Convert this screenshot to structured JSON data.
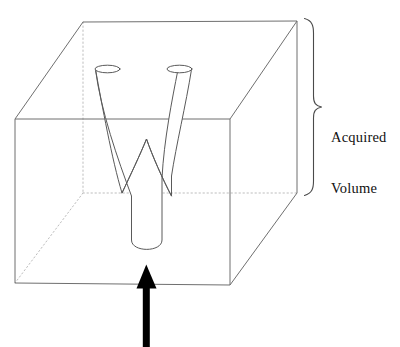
{
  "figure": {
    "background_color": "#ffffff",
    "width": 400,
    "height": 347
  },
  "annotation": {
    "label_line_1": "Acquired",
    "label_line_2": "Volume",
    "text_color": "#111111",
    "brace_name": "right-curly-brace",
    "brace_color": "#4a4a4a"
  },
  "objects": {
    "volume_box": {
      "name": "acquired-volume-box",
      "edge_color_visible": "#6f6f6f",
      "edge_color_hidden": "#b5b5b5",
      "hidden_edge_style": "dotted"
    },
    "vessel": {
      "name": "y-shaped-vessel-phantom",
      "outline_color": "#5a5a5a",
      "branch_count": 2,
      "branch_opening_shape": "ellipse"
    },
    "flow_arrow": {
      "name": "flow-direction-arrow",
      "color": "#000000",
      "direction": "up"
    }
  }
}
